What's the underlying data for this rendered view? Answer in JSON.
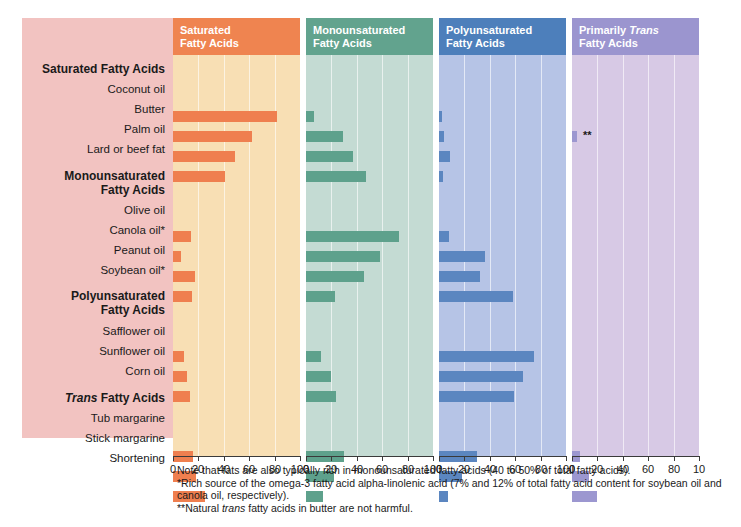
{
  "chart_data": {
    "type": "bar",
    "xlabel": "Percent of total fatty acids",
    "ylabel": "",
    "xlim": [
      0,
      100
    ],
    "grid": true,
    "legend": "none",
    "tick_values": [
      0,
      20,
      40,
      60,
      80,
      100
    ],
    "categories": [
      "Coconut oil",
      "Butter",
      "Palm oil",
      "Lard or beef fat",
      "Olive oil",
      "Canola oil*",
      "Peanut oil",
      "Soybean oil*",
      "Safflower oil",
      "Sunflower oil",
      "Corn oil",
      "Tub margarine",
      "Stick margarine",
      "Shortening"
    ],
    "series": [
      {
        "name": "Saturated Fatty Acids",
        "color": "#ef7f4f",
        "values": [
          82,
          62,
          49,
          41,
          14,
          6,
          17,
          15,
          9,
          11,
          13,
          16,
          18,
          25
        ]
      },
      {
        "name": "Monounsaturated Fatty Acids",
        "color": "#5ea18c",
        "values": [
          6,
          29,
          37,
          47,
          73,
          58,
          46,
          23,
          12,
          20,
          24,
          30,
          22,
          13
        ]
      },
      {
        "name": "Polyunsaturated Fatty Acids",
        "color": "#5b86c0",
        "values": [
          2,
          4,
          9,
          3,
          8,
          36,
          32,
          58,
          75,
          66,
          59,
          30,
          18,
          7
        ]
      },
      {
        "name": "Primarily Trans Fatty Acids",
        "color": "#9c97d0",
        "values": [
          0,
          4,
          0,
          0,
          0,
          0,
          0,
          0,
          0,
          0,
          0,
          6,
          13,
          20
        ]
      }
    ]
  },
  "panels": [
    {
      "id": "saturated",
      "header": "Saturated\nFatty Acids",
      "header_plain": "Saturated Fatty Acids",
      "header_bg": "#ef8450",
      "plot_bg": "#f8dfb4",
      "bar_color": "#ef7f4f",
      "axis_max": 100
    },
    {
      "id": "monounsaturated",
      "header": "Monounsaturated\nFatty Acids",
      "header_plain": "Monounsaturated Fatty Acids",
      "header_bg": "#62a38e",
      "plot_bg": "#c4dbd3",
      "bar_color": "#63a48f",
      "axis_max": 100
    },
    {
      "id": "polyunsaturated",
      "header": "Polyunsaturated\nFatty Acids",
      "header_plain": "Polyunsaturated Fatty Acids",
      "header_bg": "#4d7fbb",
      "plot_bg": "#b6c4e6",
      "bar_color": "#5b86c0",
      "axis_max": 100
    },
    {
      "id": "trans",
      "header_pre": "Primarily ",
      "header_em": "Trans",
      "header_post": "\nFatty Acids",
      "header_plain": "Primarily Trans Fatty Acids",
      "header_bg": "#9b95cf",
      "plot_bg": "#d7c9e5",
      "bar_color": "#9c97d0",
      "axis_max": 100
    }
  ],
  "labels": {
    "group_1": "Saturated Fatty Acids",
    "item_coconut": "Coconut oil",
    "item_butter": "Butter",
    "item_palm": "Palm oil",
    "item_lard": "Lard or beef fat",
    "group_2_line1": "Monounsaturated",
    "group_2_line2": "Fatty Acids",
    "item_olive": "Olive oil",
    "item_canola": "Canola oil*",
    "item_peanut": "Peanut oil",
    "item_soybean": "Soybean oil*",
    "group_3_line1": "Polyunsaturated",
    "group_3_line2": "Fatty Acids",
    "item_safflower": "Safflower oil",
    "item_sunflower": "Sunflower oil",
    "item_corn": "Corn oil",
    "group_4_pre": "Trans",
    "group_4_post": " Fatty Acids",
    "item_tub": "Tub margarine",
    "item_stick": "Stick margarine",
    "item_shortening": "Shortening"
  },
  "annotations": {
    "butter_trans_marker": "**"
  },
  "footnotes": {
    "line1": "Note that fats are also typically rich in monounsaturated fatty acids (40 to 50% of total fatty acids).",
    "line2": "*Rich source of the omega-3 fatty acid alpha-linolenic acid (7% and 12% of total fatty acid content for soybean oil and canola oil, respectively).",
    "line3_pre": "**Natural ",
    "line3_em": "trans",
    "line3_post": " fatty acids in butter are not harmful."
  },
  "colors": {
    "label_panel_bg": "#f2c3c1",
    "page_bg": "#ffffff",
    "axis": "#3a3a3a",
    "text": "#1a1a1a",
    "gridline": "rgba(255,255,255,0.62)"
  }
}
